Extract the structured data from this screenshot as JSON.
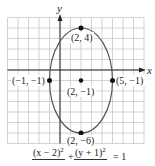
{
  "chart_data": {
    "type": "scatter",
    "title": "",
    "xlabel": "x",
    "ylabel": "y",
    "xlim": [
      -5,
      8
    ],
    "ylim": [
      -7,
      5
    ],
    "grid": true,
    "curve": {
      "kind": "ellipse",
      "center": [
        2,
        -1
      ],
      "semi_axis_x": 3,
      "semi_axis_y": 5,
      "equation": "(x − 2)²/9 + (y + 1)²/25 = 1"
    },
    "points": [
      {
        "x": 2,
        "y": 4,
        "label": "(2, 4)"
      },
      {
        "x": -1,
        "y": -1,
        "label": "(−1, −1)"
      },
      {
        "x": 2,
        "y": -1,
        "label": "(2, −1)"
      },
      {
        "x": 5,
        "y": -1,
        "label": "(5, −1)"
      },
      {
        "x": 2,
        "y": -6,
        "label": "(2, −6)"
      }
    ],
    "colors": {
      "grid": "#c8c8c8",
      "axis": "#222222",
      "ellipse": "#555555",
      "point": "#111111"
    }
  },
  "labels": {
    "x_axis": "x",
    "y_axis": "y",
    "p_top": "(2, 4)",
    "p_left": "(−1, −1)",
    "p_center": "(2, −1)",
    "p_right": "(5, −1)",
    "p_bottom": "(2, −6)"
  },
  "equation": {
    "left_numerator": "(x − 2)",
    "left_exp": "2",
    "plus": "+",
    "right_numerator": "(y + 1)",
    "right_exp": "2",
    "equals": "= 1"
  }
}
